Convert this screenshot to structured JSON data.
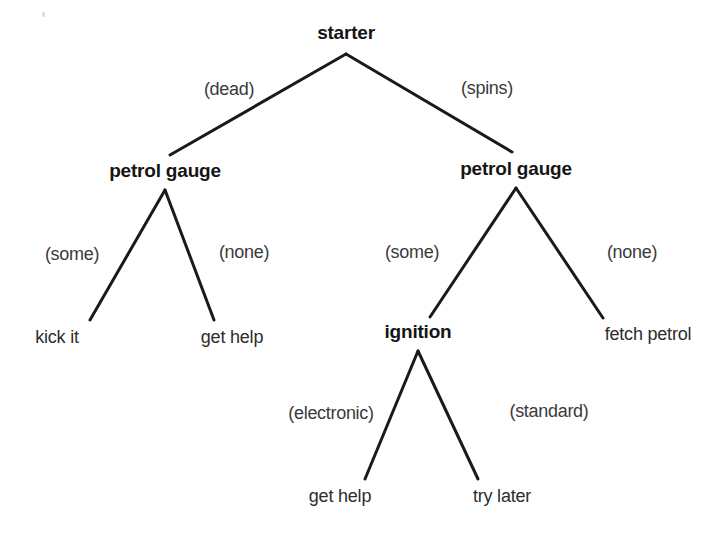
{
  "diagram": {
    "type": "decision-tree",
    "title": "",
    "background_color": "#ffffff",
    "line_color": "#1a1a1a",
    "nodes": [
      {
        "id": "root",
        "label": "starter",
        "kind": "internal",
        "x": 346,
        "y": 32
      },
      {
        "id": "petrol-left",
        "label": "petrol gauge",
        "kind": "internal",
        "x": 165,
        "y": 170
      },
      {
        "id": "petrol-right",
        "label": "petrol gauge",
        "kind": "internal",
        "x": 516,
        "y": 168
      },
      {
        "id": "kick-it",
        "label": "kick it",
        "kind": "leaf",
        "x": 57,
        "y": 337
      },
      {
        "id": "get-help-left",
        "label": "get help",
        "kind": "leaf",
        "x": 232,
        "y": 337
      },
      {
        "id": "ignition",
        "label": "ignition",
        "kind": "internal",
        "x": 418,
        "y": 331
      },
      {
        "id": "fetch-petrol",
        "label": "fetch petrol",
        "kind": "leaf",
        "x": 648,
        "y": 334
      },
      {
        "id": "get-help-bot",
        "label": "get help",
        "kind": "leaf",
        "x": 340,
        "y": 496
      },
      {
        "id": "try-later",
        "label": "try later",
        "kind": "leaf",
        "x": 502,
        "y": 496
      }
    ],
    "edges": [
      {
        "id": "edge-dead",
        "from": "root",
        "to": "petrol-left",
        "label": "(dead)",
        "x1": 346,
        "y1": 54,
        "x2": 170,
        "y2": 155,
        "lx": 229,
        "ly": 89
      },
      {
        "id": "edge-spins",
        "from": "root",
        "to": "petrol-right",
        "label": "(spins)",
        "x1": 346,
        "y1": 54,
        "x2": 512,
        "y2": 152,
        "lx": 487,
        "ly": 88
      },
      {
        "id": "edge-some-left",
        "from": "petrol-left",
        "to": "kick-it",
        "label": "(some)",
        "x1": 165,
        "y1": 190,
        "x2": 90,
        "y2": 320,
        "lx": 72,
        "ly": 254
      },
      {
        "id": "edge-none-left",
        "from": "petrol-left",
        "to": "get-help-left",
        "label": "(none)",
        "x1": 165,
        "y1": 190,
        "x2": 214,
        "y2": 320,
        "lx": 244,
        "ly": 252
      },
      {
        "id": "edge-some-right",
        "from": "petrol-right",
        "to": "ignition",
        "label": "(some)",
        "x1": 516,
        "y1": 188,
        "x2": 430,
        "y2": 317,
        "lx": 412,
        "ly": 252
      },
      {
        "id": "edge-none-right",
        "from": "petrol-right",
        "to": "fetch-petrol",
        "label": "(none)",
        "x1": 516,
        "y1": 188,
        "x2": 603,
        "y2": 318,
        "lx": 632,
        "ly": 252
      },
      {
        "id": "edge-electronic",
        "from": "ignition",
        "to": "get-help-bot",
        "label": "(electronic)",
        "x1": 418,
        "y1": 351,
        "x2": 365,
        "y2": 479,
        "lx": 331,
        "ly": 413
      },
      {
        "id": "edge-standard",
        "from": "ignition",
        "to": "try-later",
        "label": "(standard)",
        "x1": 418,
        "y1": 351,
        "x2": 478,
        "y2": 479,
        "lx": 549,
        "ly": 411
      }
    ],
    "artifacts": [
      {
        "id": "speck-1",
        "x": 42,
        "y": 12
      }
    ]
  }
}
